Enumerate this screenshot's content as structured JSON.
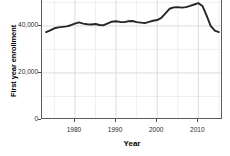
{
  "chart_data": {
    "type": "line",
    "title": "",
    "xlabel": "Year",
    "ylabel": "First year enrollment",
    "xlim": [
      1972,
      2016
    ],
    "ylim": [
      0,
      54000
    ],
    "grid": true,
    "legend": null,
    "x_ticks": [
      1980,
      1990,
      2000,
      2010
    ],
    "x_tick_labels": [
      "1980",
      "1990",
      "2000",
      "2010"
    ],
    "y_ticks": [
      0,
      20000,
      40000
    ],
    "y_tick_labels": [
      "0",
      "20,000",
      "40,000"
    ],
    "line_color": "#262626",
    "series": [
      {
        "name": "First year enrollment",
        "x": [
          1973,
          1974,
          1975,
          1976,
          1977,
          1978,
          1979,
          1980,
          1981,
          1982,
          1983,
          1984,
          1985,
          1986,
          1987,
          1988,
          1989,
          1990,
          1991,
          1992,
          1993,
          1994,
          1995,
          1996,
          1997,
          1998,
          1999,
          2000,
          2001,
          2002,
          2003,
          2004,
          2005,
          2006,
          2007,
          2008,
          2009,
          2010,
          2011,
          2012,
          2013,
          2014,
          2015
        ],
        "values": [
          37400,
          38100,
          39000,
          39400,
          39600,
          39800,
          40300,
          41000,
          41500,
          41000,
          40700,
          40600,
          40800,
          40400,
          40300,
          41100,
          41800,
          42000,
          41700,
          41600,
          42000,
          42100,
          41600,
          41400,
          41200,
          41700,
          42200,
          42500,
          43400,
          45300,
          47300,
          47900,
          48000,
          47800,
          48000,
          48500,
          49100,
          49700,
          48500,
          44500,
          40000,
          38000,
          37400
        ]
      }
    ]
  },
  "axes": {
    "y_title": "First year enrollment",
    "x_title": "Year"
  }
}
